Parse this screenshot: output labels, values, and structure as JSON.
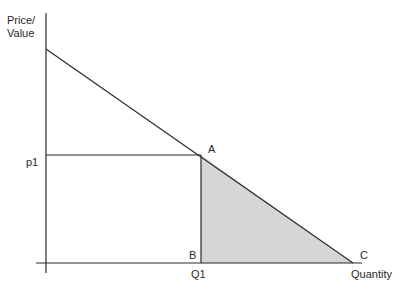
{
  "diagram": {
    "type": "consumer-surplus-demand-diagram",
    "y_axis_label_line1": "Price/",
    "y_axis_label_line2": "Value",
    "x_axis_label": "Quantity",
    "price_label": "p1",
    "quantity_label": "Q1",
    "points": {
      "A": "A",
      "B": "B",
      "C": "C"
    },
    "colors": {
      "line": "#2b2b2b",
      "shaded_area": "#d6d6d6"
    },
    "geometry": {
      "origin": [
        46,
        263
      ],
      "y_axis_top": [
        46,
        13
      ],
      "x_axis_left": [
        36,
        263
      ],
      "x_axis_right": [
        362,
        263
      ],
      "y_axis_bottom": [
        46,
        273
      ],
      "demand_start": [
        46,
        49
      ],
      "point_A": [
        201,
        155
      ],
      "point_B": [
        201,
        263
      ],
      "point_C": [
        353,
        263
      ]
    }
  }
}
